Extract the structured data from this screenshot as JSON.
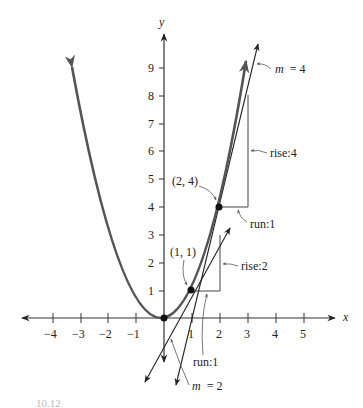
{
  "axes": {
    "x_label": "x",
    "y_label": "y",
    "x_ticks": [
      "−4",
      "−3",
      "−2",
      "−1",
      "1",
      "2",
      "3",
      "4",
      "5"
    ],
    "y_ticks": [
      "1",
      "2",
      "3",
      "4",
      "5",
      "6",
      "7",
      "8",
      "9"
    ]
  },
  "points": {
    "origin": "",
    "p1_label": "(1, 1)",
    "p2_label": "(2, 4)"
  },
  "annotations": {
    "slope_4": "m = 4",
    "slope_4_m": "m",
    "slope_4_eq": "= 4",
    "slope_2_m": "m",
    "slope_2_eq": "= 2",
    "rise_4": "rise:4",
    "run_1_upper": "run:1",
    "rise_2": "rise:2",
    "run_1_lower": "run:1"
  },
  "caption": "10.12",
  "colors": {
    "curve": "#555555",
    "axes": "#333333",
    "lines": "#222222",
    "triangles": "#444444"
  }
}
